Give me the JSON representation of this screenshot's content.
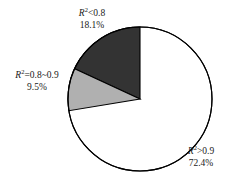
{
  "chart_data": {
    "type": "pie",
    "title": "",
    "subtitle": "",
    "xlabel": "",
    "ylabel": "",
    "legend_position": "none",
    "grid": false,
    "categories": [
      "R²<0.8",
      "R²=0.8~0.9",
      "R²>0.9"
    ],
    "values": [
      18.1,
      9.5,
      72.4
    ],
    "value_unit": "%",
    "start_angle_deg": 90,
    "direction": "counterclockwise",
    "slices": [
      {
        "label_symbol": "R",
        "label_superscript": "2",
        "label_rest": "<0.8",
        "label_full": "R²<0.8",
        "value": 18.1,
        "value_text": "18.1%",
        "color": "#333333",
        "outline": "#000000"
      },
      {
        "label_symbol": "R",
        "label_superscript": "2",
        "label_rest": "=0.8~0.9",
        "label_full": "R²=0.8~0.9",
        "value": 9.5,
        "value_text": "9.5%",
        "color": "#b0b0b0",
        "outline": "#000000"
      },
      {
        "label_symbol": "R",
        "label_superscript": "2",
        "label_rest": ">0.9",
        "label_full": "R²>0.9",
        "value": 72.4,
        "value_text": "72.4%",
        "color": "#ffffff",
        "outline": "#000000"
      }
    ]
  },
  "figure": {
    "background": "#ffffff",
    "stroke": "#000000",
    "center_x": 140,
    "center_y": 99,
    "radius": 72
  }
}
